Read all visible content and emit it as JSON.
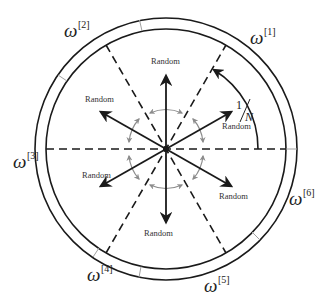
{
  "diagram": {
    "type": "circular-partition-diagram",
    "center_label": "",
    "center": {
      "x": 166,
      "y": 149
    },
    "outer_ring": {
      "outer_radius": 131,
      "inner_radius": 120,
      "segment_count": 6
    },
    "colors": {
      "line": "#1a1a1a",
      "rotation_arrows": "#8c8c8c",
      "ring_divider": "#a0a0a0",
      "text": "#222222"
    },
    "arc_annotation": {
      "numerator": "1",
      "denominator": "N",
      "separator": "/"
    },
    "direction_arrows": [
      {
        "angle_deg": 90,
        "label": "Random"
      },
      {
        "angle_deg": 150,
        "label": "Random"
      },
      {
        "angle_deg": 30,
        "label": "Random"
      },
      {
        "angle_deg": 210,
        "label": "Random"
      },
      {
        "angle_deg": 330,
        "label": "Random"
      },
      {
        "angle_deg": 270,
        "label": "Random"
      }
    ],
    "dashed_boundaries_deg": [
      0,
      60,
      120
    ],
    "segment_labels": [
      {
        "symbol": "ω",
        "index": "[1]"
      },
      {
        "symbol": "ω",
        "index": "[2]"
      },
      {
        "symbol": "ω",
        "index": "[3]"
      },
      {
        "symbol": "ω",
        "index": "[4]"
      },
      {
        "symbol": "ω",
        "index": "[5]"
      },
      {
        "symbol": "ω",
        "index": "[6]"
      }
    ]
  }
}
